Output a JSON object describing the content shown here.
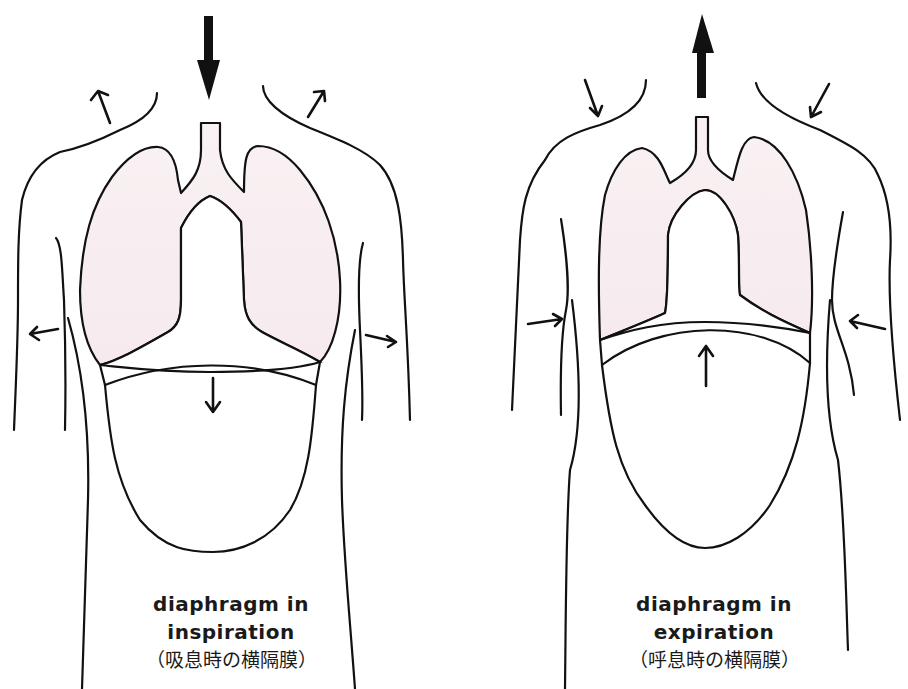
{
  "figures": [
    {
      "id": "inspiration",
      "caption_line1": "diaphragm in",
      "caption_line2": "inspiration",
      "caption_jp": "（吸息時の横隔膜）",
      "airflow_direction": "in (down)",
      "diaphragm_movement": "down",
      "rib_cage_movement": "outward",
      "shoulder_movement": "up/outward"
    },
    {
      "id": "expiration",
      "caption_line1": "diaphragm in",
      "caption_line2": "expiration",
      "caption_jp": "（呼息時の横隔膜）",
      "airflow_direction": "out (up)",
      "diaphragm_movement": "up",
      "rib_cage_movement": "inward",
      "shoulder_movement": "down/inward"
    }
  ],
  "colors": {
    "lung_fill": "#f8eef0",
    "line": "#111111",
    "background": "#ffffff"
  }
}
